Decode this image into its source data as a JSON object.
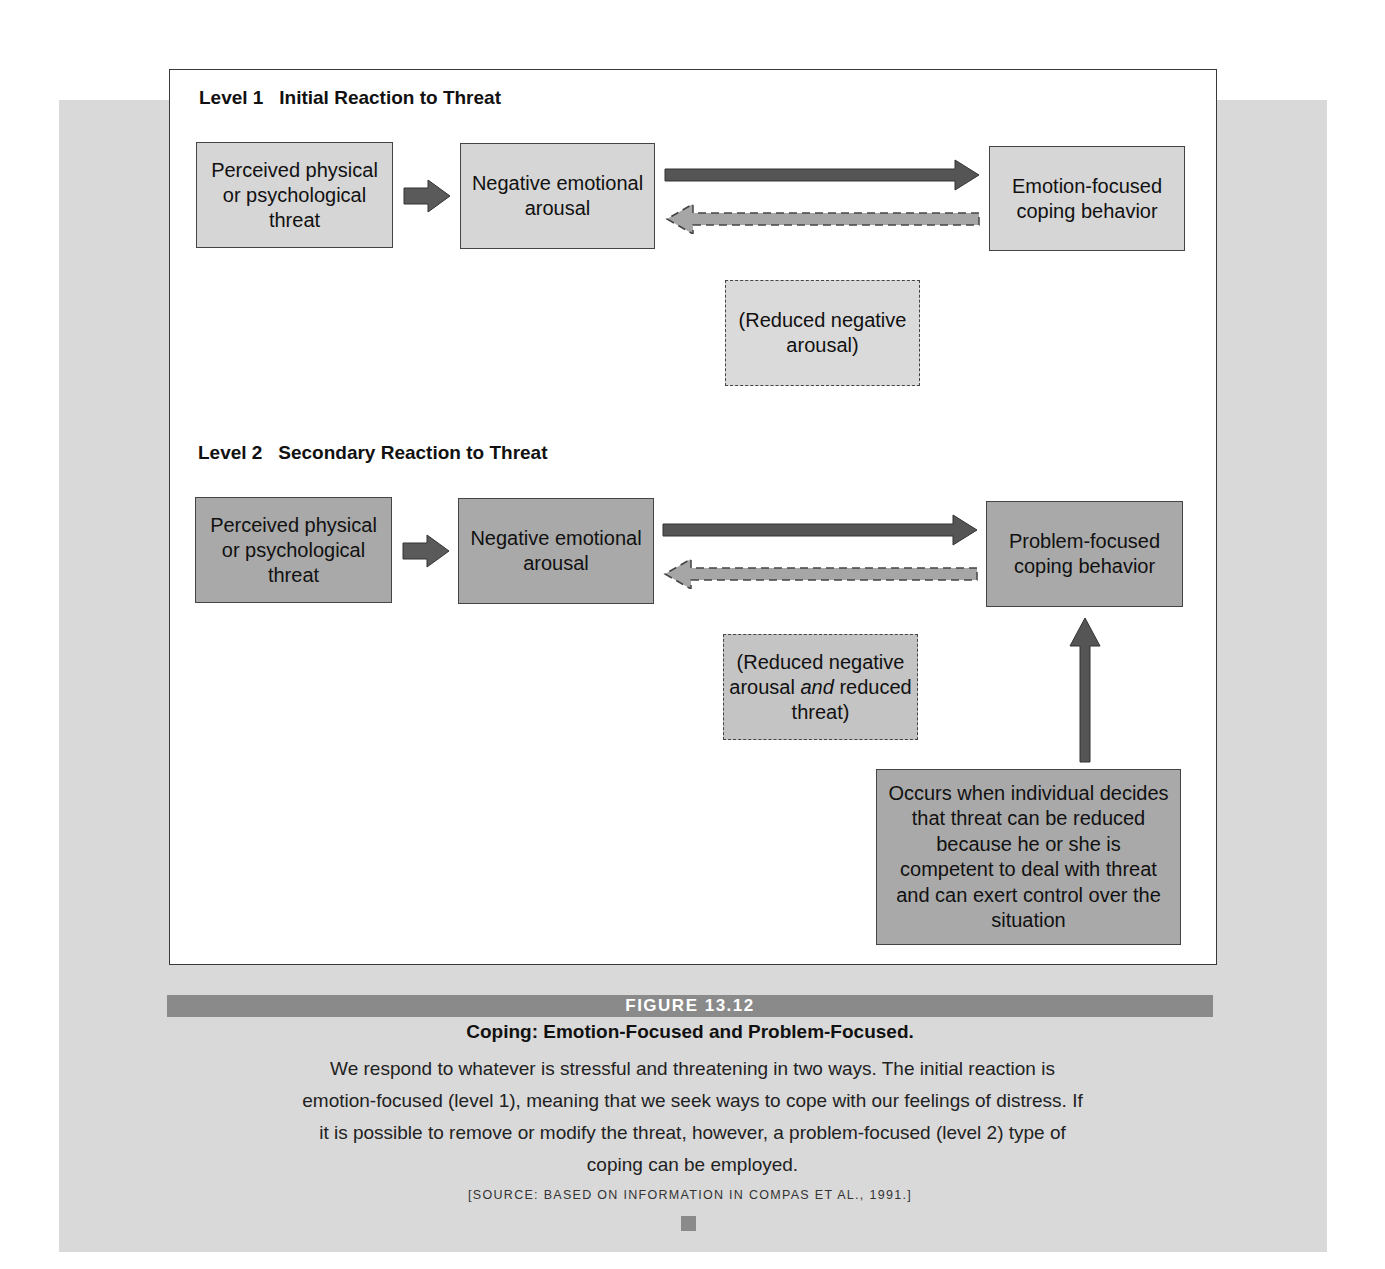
{
  "figure": {
    "number_label": "FIGURE 13.12",
    "title": "Coping: Emotion-Focused and Problem-Focused.",
    "description": "We respond to whatever is stressful and threatening in two ways. The initial reaction is emotion-focused (level 1), meaning that we seek ways to cope with our feelings of distress. If it is possible to remove or modify the threat, however, a problem-focused (level 2) type of coping can be employed.",
    "source": "[SOURCE: BASED ON INFORMATION IN COMPAS ET AL., 1991.]"
  },
  "level1": {
    "title": "Level 1   Initial Reaction to Threat",
    "threat_box": "Perceived physical or psychological threat",
    "arousal_box": "Negative emotional arousal",
    "coping_box": "Emotion-focused coping behavior",
    "outcome_box": "(Reduced negative arousal)"
  },
  "level2": {
    "title": "Level 2   Secondary Reaction to Threat",
    "threat_box": "Perceived physical or psychological threat",
    "arousal_box": "Negative emotional arousal",
    "coping_box": "Problem-focused coping behavior",
    "outcome_prefix": "(Reduced negative arousal ",
    "outcome_italic": "and",
    "outcome_suffix": " reduced threat)",
    "condition_box": "Occurs when individual decides that threat can be reduced because he or she is competent to deal with threat and can exert control over the situation"
  },
  "colors": {
    "panel_background": "#d9d9d9",
    "light_box": "#d6d6d6",
    "dark_box": "#a9a9a9",
    "solid_arrow": "#555555",
    "dashed_arrow": "#a6a6a6",
    "caption_bar": "#8a8a8a"
  }
}
